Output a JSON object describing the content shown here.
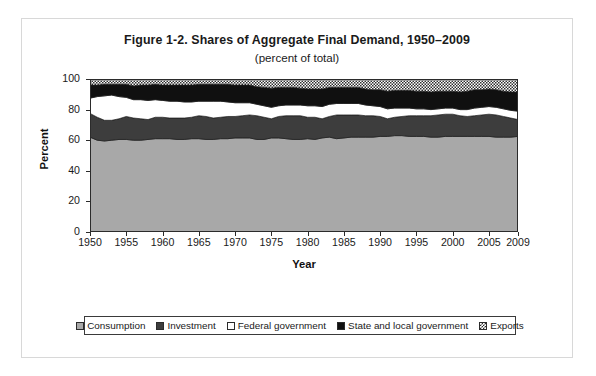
{
  "figure": {
    "title": "Figure 1-2. Shares of Aggregate Final Demand, 1950–2009",
    "subtitle": "(percent of total)"
  },
  "axes": {
    "ylabel": "Percent",
    "xlabel": "Year",
    "ytick_labels": [
      "100",
      "80",
      "60",
      "40",
      "20",
      "0"
    ],
    "xtick_labels": [
      "1950",
      "1955",
      "1960",
      "1965",
      "1970",
      "1975",
      "1980",
      "1985",
      "1990",
      "1995",
      "2000",
      "2005",
      "2009"
    ]
  },
  "legend": {
    "items": [
      {
        "label": "Consumption",
        "swatch": "light-gray-fill",
        "color": "#a8a8a8"
      },
      {
        "label": "Investment",
        "swatch": "dark-gray-fill",
        "color": "#3d3d3d"
      },
      {
        "label": "Federal government",
        "swatch": "white-fill",
        "color": "#ffffff"
      },
      {
        "label": "State and local government",
        "swatch": "black-fill",
        "color": "#101010"
      },
      {
        "label": "Exports",
        "swatch": "checkered-fill",
        "color": "#2b2b2b"
      }
    ]
  },
  "chart_data": {
    "type": "area",
    "stacked": true,
    "title": "Figure 1-2. Shares of Aggregate Final Demand, 1950–2009",
    "subtitle": "(percent of total)",
    "xlabel": "Year",
    "ylabel": "Percent",
    "xlim": [
      1950,
      2009
    ],
    "ylim": [
      0,
      100
    ],
    "ytick_step": 20,
    "xtick_step": 5,
    "grid": false,
    "legend_position": "bottom",
    "x": [
      1950,
      1951,
      1952,
      1953,
      1954,
      1955,
      1956,
      1957,
      1958,
      1959,
      1960,
      1961,
      1962,
      1963,
      1964,
      1965,
      1966,
      1967,
      1968,
      1969,
      1970,
      1971,
      1972,
      1973,
      1974,
      1975,
      1976,
      1977,
      1978,
      1979,
      1980,
      1981,
      1982,
      1983,
      1984,
      1985,
      1986,
      1987,
      1988,
      1989,
      1990,
      1991,
      1992,
      1993,
      1994,
      1995,
      1996,
      1997,
      1998,
      1999,
      2000,
      2001,
      2002,
      2003,
      2004,
      2005,
      2006,
      2007,
      2008,
      2009
    ],
    "series": [
      {
        "name": "Consumption",
        "fill": "#a8a8a8",
        "values": [
          62.0,
          60.0,
          59.5,
          60.0,
          60.5,
          60.5,
          60.0,
          60.0,
          60.5,
          61.0,
          61.0,
          61.0,
          60.5,
          60.5,
          61.0,
          61.0,
          60.5,
          60.5,
          61.0,
          61.0,
          61.5,
          61.5,
          61.5,
          60.5,
          60.5,
          61.5,
          61.5,
          61.0,
          60.5,
          60.5,
          61.0,
          60.5,
          61.5,
          62.0,
          61.0,
          61.5,
          62.0,
          62.0,
          62.0,
          62.0,
          62.5,
          62.5,
          63.0,
          63.0,
          62.5,
          62.5,
          62.5,
          62.0,
          62.0,
          62.5,
          62.5,
          62.5,
          62.5,
          62.5,
          62.5,
          62.5,
          62.0,
          62.0,
          62.0,
          62.5
        ]
      },
      {
        "name": "Investment",
        "fill": "#3d3d3d",
        "values": [
          15.5,
          15.0,
          13.5,
          13.0,
          13.5,
          15.0,
          14.5,
          14.0,
          13.0,
          14.0,
          14.0,
          13.5,
          14.0,
          14.0,
          14.0,
          15.0,
          15.0,
          14.0,
          14.0,
          14.5,
          14.0,
          14.5,
          15.0,
          15.5,
          14.5,
          12.5,
          14.0,
          15.0,
          15.5,
          15.5,
          14.0,
          14.5,
          12.5,
          13.5,
          15.5,
          15.0,
          14.5,
          14.5,
          14.0,
          14.0,
          13.0,
          11.5,
          12.0,
          12.5,
          13.5,
          13.5,
          13.5,
          14.0,
          14.5,
          14.5,
          14.5,
          13.5,
          13.0,
          13.5,
          14.0,
          14.5,
          14.5,
          13.5,
          12.5,
          11.0
        ]
      },
      {
        "name": "Federal government",
        "fill": "#ffffff",
        "values": [
          10.0,
          13.5,
          16.0,
          16.5,
          14.5,
          12.5,
          12.0,
          12.5,
          12.5,
          11.5,
          11.0,
          11.0,
          11.0,
          10.5,
          10.0,
          9.5,
          10.0,
          11.0,
          10.5,
          9.5,
          9.0,
          8.5,
          8.0,
          7.5,
          7.5,
          7.5,
          7.0,
          7.0,
          7.0,
          7.0,
          7.5,
          7.5,
          8.0,
          8.0,
          7.5,
          7.5,
          7.5,
          7.5,
          7.0,
          6.5,
          6.5,
          6.5,
          6.0,
          5.5,
          5.0,
          4.5,
          4.5,
          4.0,
          4.0,
          4.0,
          4.0,
          4.0,
          4.5,
          5.0,
          5.0,
          5.0,
          5.0,
          5.0,
          5.0,
          5.5
        ]
      },
      {
        "name": "State and local government",
        "fill": "#101010",
        "values": [
          8.5,
          7.5,
          7.5,
          7.0,
          8.0,
          8.5,
          9.0,
          9.5,
          10.0,
          10.0,
          10.0,
          10.5,
          10.5,
          11.0,
          11.0,
          11.0,
          11.0,
          11.0,
          11.0,
          11.5,
          11.5,
          11.5,
          11.5,
          11.5,
          12.0,
          12.5,
          12.0,
          11.5,
          11.5,
          11.0,
          11.0,
          11.0,
          11.5,
          11.0,
          10.5,
          10.5,
          10.5,
          10.5,
          10.5,
          10.5,
          11.0,
          11.5,
          11.5,
          11.5,
          11.5,
          11.5,
          11.5,
          11.5,
          11.5,
          11.0,
          11.0,
          11.5,
          12.0,
          12.0,
          11.5,
          11.5,
          11.5,
          11.5,
          12.0,
          12.5
        ]
      },
      {
        "name": "Exports",
        "fill": "checkered",
        "values": [
          4.0,
          4.0,
          3.5,
          3.5,
          3.5,
          3.5,
          4.5,
          4.0,
          4.0,
          3.5,
          4.0,
          4.0,
          4.0,
          4.0,
          4.0,
          3.5,
          3.5,
          3.5,
          3.5,
          3.5,
          4.0,
          4.0,
          4.0,
          5.0,
          5.5,
          6.0,
          5.5,
          5.5,
          5.5,
          6.0,
          6.5,
          6.5,
          6.5,
          5.5,
          5.5,
          5.5,
          5.5,
          5.5,
          6.5,
          7.0,
          7.0,
          8.0,
          7.5,
          7.5,
          7.5,
          8.0,
          8.0,
          8.5,
          8.0,
          8.0,
          8.0,
          8.5,
          8.0,
          7.0,
          7.0,
          6.5,
          7.0,
          8.0,
          8.5,
          8.5
        ]
      }
    ]
  }
}
